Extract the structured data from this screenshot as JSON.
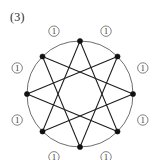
{
  "figure": {
    "label": "(3)",
    "kind": "graph-diagram",
    "background_color": "#ffffff",
    "vertex_color": "#111111",
    "arc_color": "#5e5e5e",
    "chord_color": "#1c1c1c",
    "label_color": "#2b2b2b"
  },
  "layout": {
    "center_x": 80,
    "center_y": 94,
    "radius": 53,
    "label_radius": 68,
    "vertex_dot_radius": 2.6,
    "edge_label_circle_radius": 5.2,
    "vertex_count": 8,
    "start_angle_deg": -90,
    "chord_step": 3
  },
  "vertices": [
    {
      "id": "v0",
      "name": "vertex-top",
      "x": 80,
      "y": 41
    },
    {
      "id": "v1",
      "name": "vertex-upper-right",
      "x": 117.5,
      "y": 56.5
    },
    {
      "id": "v2",
      "name": "vertex-right",
      "x": 133,
      "y": 94
    },
    {
      "id": "v3",
      "name": "vertex-lower-right",
      "x": 117.5,
      "y": 131.5
    },
    {
      "id": "v4",
      "name": "vertex-bottom",
      "x": 80,
      "y": 147
    },
    {
      "id": "v5",
      "name": "vertex-lower-left",
      "x": 42.5,
      "y": 131.5
    },
    {
      "id": "v6",
      "name": "vertex-left",
      "x": 27,
      "y": 94
    },
    {
      "id": "v7",
      "name": "vertex-upper-left",
      "x": 42.5,
      "y": 56.5
    }
  ],
  "arc_edges": [
    {
      "from": "v0",
      "to": "v1",
      "label": "1",
      "label_angle_deg": -67.5
    },
    {
      "from": "v1",
      "to": "v2",
      "label": "1",
      "label_angle_deg": -22.5
    },
    {
      "from": "v2",
      "to": "v3",
      "label": "1",
      "label_angle_deg": 22.5
    },
    {
      "from": "v3",
      "to": "v4",
      "label": "1",
      "label_angle_deg": 67.5
    },
    {
      "from": "v4",
      "to": "v5",
      "label": "1",
      "label_angle_deg": 112.5
    },
    {
      "from": "v5",
      "to": "v6",
      "label": "1",
      "label_angle_deg": 157.5
    },
    {
      "from": "v6",
      "to": "v7",
      "label": "1",
      "label_angle_deg": 202.5
    },
    {
      "from": "v7",
      "to": "v0",
      "label": "1",
      "label_angle_deg": 247.5
    }
  ],
  "chord_edges": [
    {
      "from": "v0",
      "to": "v3"
    },
    {
      "from": "v1",
      "to": "v4"
    },
    {
      "from": "v2",
      "to": "v5"
    },
    {
      "from": "v3",
      "to": "v6"
    },
    {
      "from": "v4",
      "to": "v7"
    },
    {
      "from": "v5",
      "to": "v0"
    },
    {
      "from": "v6",
      "to": "v1"
    },
    {
      "from": "v7",
      "to": "v2"
    }
  ]
}
